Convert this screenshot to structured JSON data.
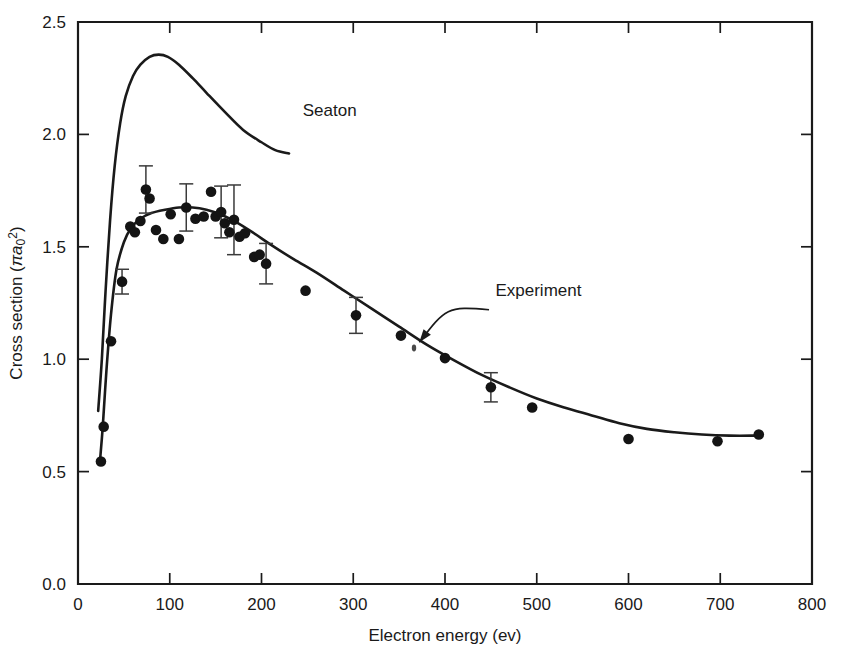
{
  "chart_data": {
    "type": "scatter",
    "title": "",
    "xlabel": "Electron energy (ev)",
    "ylabel": "Cross section (πa₀²)",
    "ylabel_parts": {
      "prefix": "Cross section (",
      "pi": "π",
      "a": "a",
      "sub": "0",
      "sup": "2",
      "suffix": ")"
    },
    "xlim": [
      0,
      800
    ],
    "ylim": [
      0.0,
      2.5
    ],
    "xticks": [
      0,
      100,
      200,
      300,
      400,
      500,
      600,
      700,
      800
    ],
    "xtick_labels": [
      "0",
      "100",
      "200",
      "300",
      "400",
      "500",
      "600",
      "700",
      "800"
    ],
    "yticks": [
      0.0,
      0.5,
      1.0,
      1.5,
      2.0,
      2.5
    ],
    "ytick_labels": [
      "0.0",
      "0.5",
      "1.0",
      "1.5",
      "2.0",
      "2.5"
    ],
    "grid": false,
    "legend_position": "inline-annotations",
    "series": [
      {
        "name": "Seaton",
        "kind": "line",
        "label": "Seaton",
        "label_x": 245,
        "label_y": 2.08,
        "points": [
          [
            22,
            0.77
          ],
          [
            26,
            1.0
          ],
          [
            30,
            1.3
          ],
          [
            35,
            1.62
          ],
          [
            40,
            1.86
          ],
          [
            46,
            2.05
          ],
          [
            52,
            2.17
          ],
          [
            60,
            2.26
          ],
          [
            68,
            2.31
          ],
          [
            78,
            2.345
          ],
          [
            88,
            2.355
          ],
          [
            98,
            2.345
          ],
          [
            110,
            2.31
          ],
          [
            125,
            2.25
          ],
          [
            140,
            2.185
          ],
          [
            160,
            2.1
          ],
          [
            180,
            2.02
          ],
          [
            200,
            1.965
          ],
          [
            215,
            1.93
          ],
          [
            230,
            1.915
          ]
        ]
      },
      {
        "name": "Experiment",
        "kind": "line-with-points",
        "label": "Experiment",
        "label_x": 455,
        "label_y": 1.28,
        "arrow_from_x": 448,
        "arrow_from_y": 1.22,
        "arrow_to_x": 372,
        "arrow_to_y": 1.075,
        "curve": [
          [
            24,
            0.55
          ],
          [
            27,
            0.7
          ],
          [
            31,
            0.95
          ],
          [
            36,
            1.2
          ],
          [
            42,
            1.4
          ],
          [
            50,
            1.52
          ],
          [
            58,
            1.585
          ],
          [
            68,
            1.625
          ],
          [
            80,
            1.65
          ],
          [
            95,
            1.665
          ],
          [
            110,
            1.675
          ],
          [
            125,
            1.675
          ],
          [
            140,
            1.665
          ],
          [
            155,
            1.645
          ],
          [
            170,
            1.615
          ],
          [
            190,
            1.565
          ],
          [
            210,
            1.51
          ],
          [
            235,
            1.445
          ],
          [
            260,
            1.385
          ],
          [
            290,
            1.305
          ],
          [
            320,
            1.225
          ],
          [
            350,
            1.145
          ],
          [
            380,
            1.065
          ],
          [
            410,
            0.995
          ],
          [
            440,
            0.93
          ],
          [
            470,
            0.875
          ],
          [
            500,
            0.825
          ],
          [
            530,
            0.785
          ],
          [
            560,
            0.75
          ],
          [
            590,
            0.715
          ],
          [
            620,
            0.69
          ],
          [
            650,
            0.675
          ],
          [
            680,
            0.665
          ],
          [
            710,
            0.66
          ],
          [
            740,
            0.66
          ]
        ],
        "markers": [
          {
            "x": 25,
            "y": 0.545
          },
          {
            "x": 28,
            "y": 0.7
          },
          {
            "x": 36,
            "y": 1.08
          },
          {
            "x": 48,
            "y": 1.345,
            "err": 0.055
          },
          {
            "x": 57,
            "y": 1.59
          },
          {
            "x": 62,
            "y": 1.565
          },
          {
            "x": 68,
            "y": 1.615
          },
          {
            "x": 74,
            "y": 1.755,
            "err": 0.105
          },
          {
            "x": 78,
            "y": 1.715
          },
          {
            "x": 85,
            "y": 1.575
          },
          {
            "x": 93,
            "y": 1.535
          },
          {
            "x": 101,
            "y": 1.645
          },
          {
            "x": 110,
            "y": 1.535
          },
          {
            "x": 118,
            "y": 1.675,
            "err": 0.105
          },
          {
            "x": 128,
            "y": 1.625
          },
          {
            "x": 137,
            "y": 1.635
          },
          {
            "x": 145,
            "y": 1.745
          },
          {
            "x": 150,
            "y": 1.635
          },
          {
            "x": 156,
            "y": 1.655,
            "err": 0.115
          },
          {
            "x": 160,
            "y": 1.605
          },
          {
            "x": 165,
            "y": 1.565
          },
          {
            "x": 170,
            "y": 1.62,
            "err": 0.155
          },
          {
            "x": 176,
            "y": 1.545
          },
          {
            "x": 182,
            "y": 1.56
          },
          {
            "x": 192,
            "y": 1.455
          },
          {
            "x": 198,
            "y": 1.465
          },
          {
            "x": 205,
            "y": 1.425,
            "err": 0.09
          },
          {
            "x": 248,
            "y": 1.305
          },
          {
            "x": 303,
            "y": 1.195,
            "err": 0.08
          },
          {
            "x": 352,
            "y": 1.105
          },
          {
            "x": 400,
            "y": 1.005
          },
          {
            "x": 450,
            "y": 0.875,
            "err": 0.065
          },
          {
            "x": 495,
            "y": 0.785
          },
          {
            "x": 600,
            "y": 0.645
          },
          {
            "x": 697,
            "y": 0.635
          },
          {
            "x": 742,
            "y": 0.665
          }
        ]
      }
    ]
  },
  "annotations": {
    "seaton_label": "Seaton",
    "experiment_label": "Experiment"
  }
}
